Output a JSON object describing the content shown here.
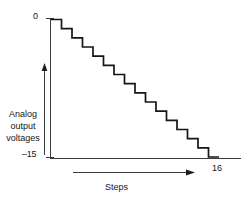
{
  "figure": {
    "kind": "staircase-waveform-diagram",
    "background": "#ffffff",
    "line_color": "#161616"
  },
  "labels": {
    "y_top": "0",
    "y_bottom": "–15",
    "y_axis_title_line1": "Analog",
    "y_axis_title_line2": "output",
    "y_axis_title_line3": "voltages",
    "x_axis_title": "Steps",
    "x_right": "16"
  },
  "icons": {
    "y_arrow": "arrow-up-icon",
    "x_arrow": "arrow-right-icon"
  },
  "chart_data": {
    "type": "line",
    "title": "",
    "xlabel": "Steps",
    "ylabel": "Analog output voltages",
    "xlim": [
      0,
      16
    ],
    "ylim": [
      -15,
      0
    ],
    "xticks": [
      0,
      16
    ],
    "xticklabels": [
      "0",
      "16"
    ],
    "yticks": [
      0,
      -15
    ],
    "yticklabels": [
      "0",
      "–15"
    ],
    "grid": false,
    "legend": null,
    "drawstyle": "steps-post",
    "x": [
      0,
      1,
      2,
      3,
      4,
      5,
      6,
      7,
      8,
      9,
      10,
      11,
      12,
      13,
      14,
      15,
      16
    ],
    "values": [
      0,
      -1,
      -2,
      -3,
      -4,
      -5,
      -6,
      -7,
      -8,
      -9,
      -10,
      -11,
      -12,
      -13,
      -14,
      -15,
      -15
    ]
  }
}
